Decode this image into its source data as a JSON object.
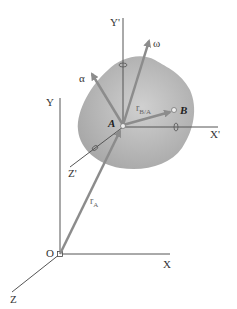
{
  "figure": {
    "type": "rigid-body-kinematics",
    "labels": {
      "Y": "Y",
      "X": "X",
      "Z": "Z",
      "O": "O",
      "Y_prime": "Y'",
      "X_prime": "X'",
      "Z_prime": "Z'",
      "A": "A",
      "B": "B",
      "omega": "ω",
      "alpha": "α",
      "r_A": "r",
      "r_A_sub": "A",
      "r_BA": "r",
      "r_BA_sub": "B/A"
    },
    "colors": {
      "body_fill": "#b5b5b5",
      "axis": "#555555",
      "vector": "#8c8c8c",
      "background": "#ffffff"
    }
  }
}
